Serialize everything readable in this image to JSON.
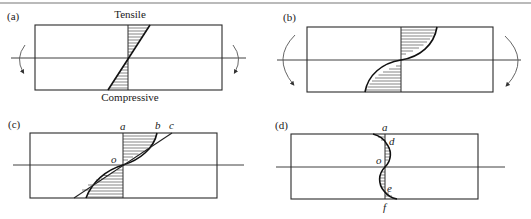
{
  "figure": {
    "top_rule": true,
    "panels": [
      {
        "id": "a",
        "label": "(a)",
        "description": "Linear elastic bending stress distribution",
        "annotations": {
          "top": "Tensile",
          "bottom": "Compressive"
        },
        "moment_arrows": "small, both sides, pointing down-outward"
      },
      {
        "id": "b",
        "label": "(b)",
        "description": "Nonlinear (elastic-plastic) bending stress distribution",
        "moment_arrows": "large, both sides"
      },
      {
        "id": "c",
        "label": "(c)",
        "description": "Stress distributions during loading",
        "points": {
          "a": "a",
          "b": "b",
          "c": "c",
          "o": "o"
        }
      },
      {
        "id": "d",
        "label": "(d)",
        "description": "Residual stress distribution after unloading",
        "points": {
          "a": "a",
          "d": "d",
          "o": "o",
          "e": "e",
          "f": "f"
        }
      }
    ]
  }
}
